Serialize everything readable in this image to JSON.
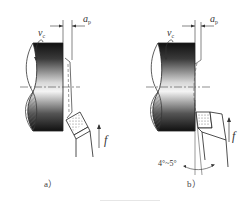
{
  "figure": {
    "panels": [
      {
        "id": "a",
        "caption": "a）",
        "labels": {
          "cutting_speed": "v",
          "cutting_speed_sub": "c",
          "depth_of_cut": "a",
          "depth_of_cut_sub": "p",
          "feed": "f"
        }
      },
      {
        "id": "b",
        "caption": "b）",
        "labels": {
          "cutting_speed": "v",
          "cutting_speed_sub": "c",
          "depth_of_cut": "a",
          "depth_of_cut_sub": "p",
          "feed": "f",
          "angle": "4°~5°"
        }
      }
    ],
    "colors": {
      "line": "#333333",
      "workpiece_dark": "#1a1a1a",
      "workpiece_light": "#f2f2f2",
      "hatch": "#555555",
      "background": "#ffffff"
    }
  }
}
